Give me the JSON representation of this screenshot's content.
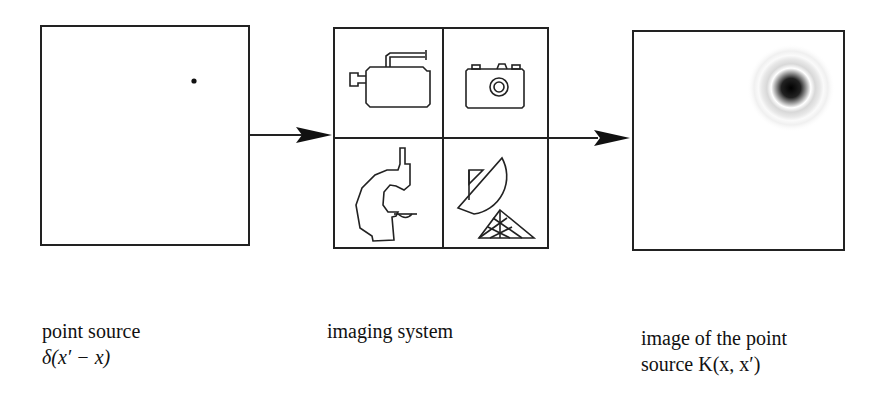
{
  "diagram": {
    "nodes": [
      {
        "id": "point-source",
        "label_line1": "point source",
        "label_line2": "δ(x′ − x)"
      },
      {
        "id": "imaging-system",
        "label_line1": "imaging system",
        "icons": [
          "video-camera",
          "photo-camera",
          "microscope",
          "radio-telescope"
        ]
      },
      {
        "id": "point-image",
        "label_line1": "image of the point",
        "label_line2": "source K(x, x′)"
      }
    ],
    "edges": [
      {
        "from": "point-source",
        "to": "imaging-system"
      },
      {
        "from": "imaging-system",
        "to": "point-image"
      }
    ],
    "colors": {
      "stroke": "#222222",
      "background": "#ffffff"
    }
  }
}
